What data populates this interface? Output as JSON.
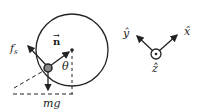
{
  "diagram": {
    "left": {
      "labels": {
        "friction": "f",
        "friction_sub": "s",
        "normal": "n",
        "normal_arrow": "→",
        "angle": "θ",
        "weight": "mg"
      }
    },
    "right": {
      "labels": {
        "x": "x̂",
        "y": "ŷ",
        "z": "ẑ"
      }
    },
    "colors": {
      "stroke": "#222222",
      "ball_fill": "#888888",
      "background": "#ffffff"
    }
  }
}
